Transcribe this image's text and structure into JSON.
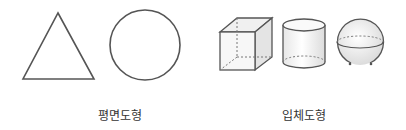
{
  "groups": {
    "plane": {
      "label": "평면도형",
      "shapes": [
        "triangle",
        "circle"
      ]
    },
    "solid": {
      "label": "입체도형",
      "shapes": [
        "cube",
        "cylinder",
        "sphere"
      ]
    }
  },
  "colors": {
    "stroke": "#555555",
    "dashed": "#777777",
    "fill_light": "#f2f2f2"
  }
}
